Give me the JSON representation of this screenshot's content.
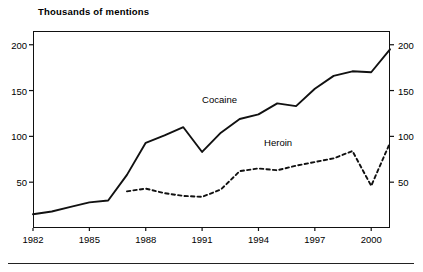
{
  "chart_data": {
    "type": "line",
    "title": "Thousands of mentions",
    "xlabel": "",
    "ylabel": "",
    "xlim": [
      1982,
      2001
    ],
    "ylim": [
      0,
      215
    ],
    "grid": false,
    "legend_position": "inline-annotation",
    "dual_y_axis": true,
    "y_ticks": [
      50,
      100,
      150,
      200
    ],
    "y_tick_labels": [
      "50",
      "100",
      "150",
      "200"
    ],
    "x_ticks": [
      1982,
      1985,
      1988,
      1991,
      1994,
      1997,
      2000
    ],
    "x_tick_labels": [
      "1982",
      "1985",
      "1988",
      "1991",
      "1994",
      "1997",
      "2000"
    ],
    "x": [
      1982,
      1983,
      1984,
      1985,
      1986,
      1987,
      1988,
      1989,
      1990,
      1991,
      1992,
      1993,
      1994,
      1995,
      1996,
      1997,
      1998,
      1999,
      2000,
      2001
    ],
    "series": [
      {
        "name": "Cocaine",
        "style": "solid",
        "color": "#111111",
        "values": [
          15,
          18,
          23,
          28,
          30,
          58,
          93,
          101,
          110,
          83,
          104,
          119,
          124,
          136,
          133,
          152,
          166,
          171,
          170,
          195
        ]
      },
      {
        "name": "Heroin",
        "style": "dashed",
        "color": "#111111",
        "start_year": 1987,
        "values": [
          null,
          null,
          null,
          null,
          null,
          40,
          43,
          38,
          35,
          34,
          42,
          62,
          65,
          63,
          68,
          72,
          76,
          84,
          46,
          93
        ]
      }
    ],
    "annotations": [
      {
        "text": "Cocaine",
        "x": 1991.0,
        "y": 140
      },
      {
        "text": "Heroin",
        "x": 1994.3,
        "y": 93
      }
    ]
  }
}
